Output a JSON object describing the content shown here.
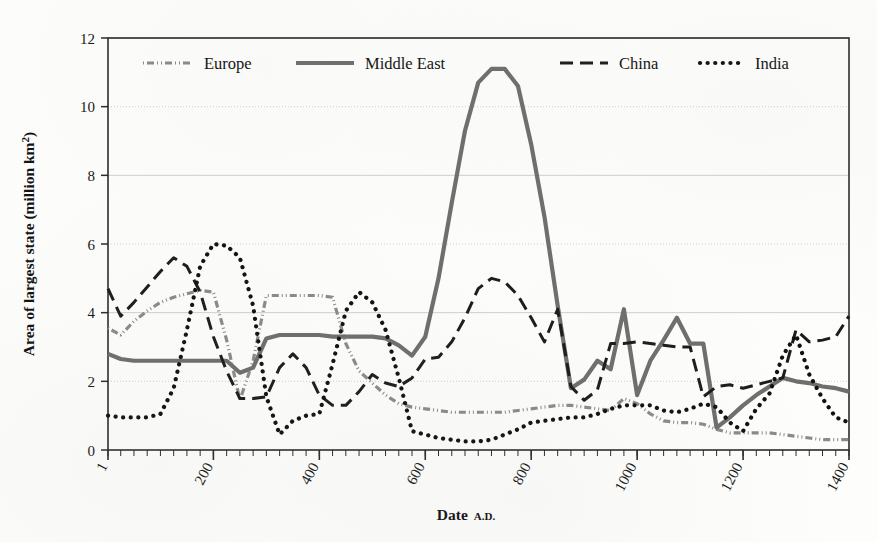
{
  "figure": {
    "background_color": "#fdfdfc",
    "plot_border_color": "#2b2b2b"
  },
  "axes": {
    "y_title_main": "Area of largest state (million km",
    "y_title_sup": "2",
    "y_title_close": ")",
    "y_title_full": "Area of largest state (million km²)",
    "x_title_main": "Date",
    "x_title_small": "A.D.",
    "y_ticks": [
      "0",
      "2",
      "4",
      "6",
      "8",
      "10",
      "12"
    ],
    "x_ticks": [
      "1",
      "200",
      "400",
      "600",
      "800",
      "1000",
      "1200",
      "1400"
    ]
  },
  "legend": {
    "position": "top-inside",
    "entries": [
      {
        "label": "Europe",
        "style": "dash-dot-dot",
        "color": "#8a8a8a",
        "width": 3.2,
        "dash": "1,3,7,3,1,3"
      },
      {
        "label": "Middle East",
        "style": "solid",
        "color": "#6e6e6e",
        "width": 4.2,
        "dash": ""
      },
      {
        "label": "China",
        "style": "long-dash",
        "color": "#1c1c1c",
        "width": 3.0,
        "dash": "13,7"
      },
      {
        "label": "India",
        "style": "dotted",
        "color": "#111111",
        "width": 4.2,
        "dash": "0.1,7.5"
      }
    ]
  },
  "chart_data": {
    "type": "line",
    "title": "",
    "xlabel": "Date A.D.",
    "ylabel": "Area of largest state (million km²)",
    "xlim": [
      1,
      1400
    ],
    "ylim": [
      0,
      12
    ],
    "grid": true,
    "grid_axis": "y",
    "legend_position": "top-inside",
    "x": [
      1,
      25,
      50,
      75,
      100,
      125,
      150,
      175,
      200,
      225,
      250,
      275,
      300,
      325,
      350,
      375,
      400,
      425,
      450,
      475,
      500,
      525,
      550,
      575,
      600,
      625,
      650,
      675,
      700,
      725,
      750,
      775,
      800,
      825,
      850,
      875,
      900,
      925,
      950,
      975,
      1000,
      1025,
      1050,
      1075,
      1100,
      1125,
      1150,
      1175,
      1200,
      1225,
      1250,
      1275,
      1300,
      1325,
      1350,
      1375,
      1400
    ],
    "series": [
      {
        "name": "Europe",
        "color": "#8a8a8a",
        "style": "dash-dot-dot",
        "values": [
          3.55,
          3.35,
          3.75,
          4.05,
          4.3,
          4.45,
          4.55,
          4.65,
          4.6,
          3.2,
          1.45,
          2.6,
          4.5,
          4.5,
          4.5,
          4.5,
          4.5,
          4.45,
          3.1,
          2.3,
          1.95,
          1.6,
          1.35,
          1.25,
          1.2,
          1.15,
          1.1,
          1.1,
          1.1,
          1.1,
          1.1,
          1.15,
          1.2,
          1.25,
          1.3,
          1.3,
          1.25,
          1.2,
          1.15,
          1.5,
          1.35,
          1.05,
          0.85,
          0.8,
          0.8,
          0.75,
          0.6,
          0.5,
          0.5,
          0.5,
          0.5,
          0.45,
          0.4,
          0.35,
          0.3,
          0.3,
          0.3
        ]
      },
      {
        "name": "Middle East",
        "color": "#6e6e6e",
        "style": "solid",
        "values": [
          2.8,
          2.65,
          2.6,
          2.6,
          2.6,
          2.6,
          2.6,
          2.6,
          2.6,
          2.6,
          2.25,
          2.4,
          3.25,
          3.35,
          3.35,
          3.35,
          3.35,
          3.3,
          3.3,
          3.3,
          3.3,
          3.25,
          3.05,
          2.75,
          3.3,
          5.0,
          7.2,
          9.3,
          10.7,
          11.1,
          11.1,
          10.6,
          8.9,
          6.8,
          4.2,
          1.8,
          2.05,
          2.6,
          2.35,
          4.1,
          1.6,
          2.6,
          3.2,
          3.85,
          3.1,
          3.1,
          0.65,
          0.95,
          1.3,
          1.6,
          1.85,
          2.1,
          2.0,
          1.95,
          1.85,
          1.8,
          1.7
        ]
      },
      {
        "name": "China",
        "color": "#1c1c1c",
        "style": "long-dash",
        "values": [
          4.7,
          3.9,
          4.3,
          4.75,
          5.2,
          5.6,
          5.35,
          4.6,
          3.3,
          2.3,
          1.5,
          1.5,
          1.55,
          2.4,
          2.8,
          2.4,
          1.6,
          1.3,
          1.3,
          1.7,
          2.2,
          1.95,
          1.85,
          2.1,
          2.65,
          2.7,
          3.15,
          3.85,
          4.7,
          5.0,
          4.9,
          4.5,
          3.85,
          3.15,
          4.1,
          1.85,
          1.45,
          1.75,
          3.1,
          3.1,
          3.15,
          3.1,
          3.05,
          3.0,
          3.0,
          1.55,
          1.85,
          1.9,
          1.8,
          1.9,
          2.0,
          2.1,
          3.5,
          3.15,
          3.2,
          3.3,
          3.9
        ]
      },
      {
        "name": "India",
        "color": "#111111",
        "style": "dotted",
        "values": [
          1.0,
          0.95,
          0.95,
          0.95,
          1.05,
          1.8,
          3.5,
          5.35,
          6.0,
          5.95,
          5.6,
          4.2,
          1.55,
          0.45,
          0.85,
          1.0,
          1.05,
          2.5,
          4.05,
          4.6,
          4.3,
          3.5,
          2.1,
          0.55,
          0.45,
          0.35,
          0.3,
          0.25,
          0.25,
          0.3,
          0.45,
          0.6,
          0.8,
          0.85,
          0.9,
          0.95,
          0.95,
          1.05,
          1.2,
          1.3,
          1.3,
          1.3,
          1.15,
          1.1,
          1.2,
          1.35,
          1.25,
          0.8,
          0.55,
          1.2,
          1.65,
          2.75,
          3.35,
          2.2,
          1.5,
          0.95,
          0.8
        ]
      }
    ]
  }
}
